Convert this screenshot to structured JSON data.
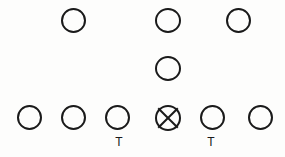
{
  "diagram": {
    "width": 285,
    "height": 157,
    "background_color": "#fdfdfc",
    "stroke_color": "#1a1a1a",
    "stroke_width": 2,
    "circle_diameter": 25
  },
  "rows": {
    "back_row": {
      "label": "Backfield Row",
      "y": 8
    },
    "middle_row": {
      "label": "Middle Row",
      "y": 56
    },
    "line_row": {
      "label": "Line of Scrimmage Row",
      "y": 105
    }
  },
  "players": [
    {
      "id": "back-left",
      "name": "Back Left Player",
      "symbol": "circle",
      "x": 61,
      "y": 8
    },
    {
      "id": "back-middle",
      "name": "Back Middle Player",
      "symbol": "circle",
      "x": 155,
      "y": 8
    },
    {
      "id": "back-right",
      "name": "Back Right Player",
      "symbol": "circle",
      "x": 226,
      "y": 8
    },
    {
      "id": "mid-center",
      "name": "Middle Center Player",
      "symbol": "circle",
      "x": 155,
      "y": 56
    },
    {
      "id": "line-1",
      "name": "Line Player 1",
      "symbol": "circle",
      "x": 17,
      "y": 105
    },
    {
      "id": "line-2",
      "name": "Line Player 2",
      "symbol": "circle",
      "x": 61,
      "y": 105
    },
    {
      "id": "line-3",
      "name": "Line Player 3 (Tackle)",
      "symbol": "circle",
      "x": 105,
      "y": 105
    },
    {
      "id": "line-center",
      "name": "Center (Ball)",
      "symbol": "circle-x",
      "x": 155,
      "y": 105
    },
    {
      "id": "line-5",
      "name": "Line Player 5 (Tackle)",
      "symbol": "circle",
      "x": 200,
      "y": 105
    },
    {
      "id": "line-6",
      "name": "Line Player 6",
      "symbol": "circle",
      "x": 248,
      "y": 105
    }
  ],
  "labels": [
    {
      "id": "tackle-left",
      "text": "T",
      "x": 118,
      "y": 136,
      "for": "line-3"
    },
    {
      "id": "tackle-right",
      "text": "T",
      "x": 210,
      "y": 136,
      "for": "line-5"
    }
  ]
}
